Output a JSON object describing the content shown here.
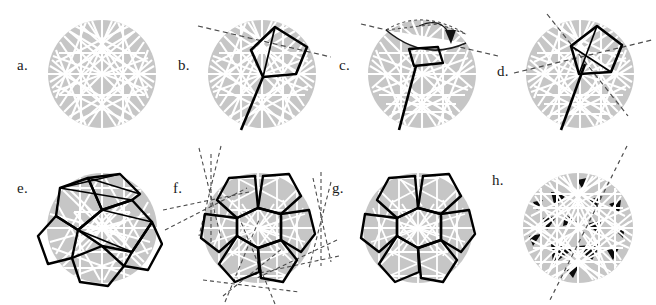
{
  "figure": {
    "type": "geometric-construction-sequence",
    "background_color": "#ffffff",
    "disk_fill_color": "#c6c6c6",
    "chord_color": "#ffffff",
    "heavy_line_color": "#000000",
    "dashed_line_color": "#4d4d4d",
    "dark_fill_color": "#0a0a0a",
    "panel_count": 8,
    "rows": 2,
    "columns": 4,
    "width": 651,
    "height": 305
  },
  "panels": [
    {
      "id": "a",
      "label": "a.",
      "label_x": 17,
      "label_y": 57,
      "cx": 102,
      "cy": 74,
      "r": 54,
      "description": "disk with full white chord arrangement",
      "has_disk": true,
      "has_chords": true,
      "chord_count": 34,
      "heavy_polygon": false,
      "dashed_lines": 0,
      "dark_triangles": 0,
      "arrow": false
    },
    {
      "id": "b",
      "label": "b.",
      "label_x": 178,
      "label_y": 57,
      "cx": 262,
      "cy": 74,
      "r": 54,
      "description": "pentagon outlined heavy with cut line and one dashed secant",
      "has_disk": true,
      "has_chords": true,
      "chord_count": 30,
      "heavy_polygon": true,
      "dashed_lines": 1,
      "dark_triangles": 0,
      "arrow": false
    },
    {
      "id": "c",
      "label": "c.",
      "label_x": 335,
      "label_y": 57,
      "cx": 422,
      "cy": 74,
      "r": 54,
      "description": "flap folded over with curved rotation arrow and dotted outline of pre-fold position",
      "has_disk": true,
      "has_chords": true,
      "chord_count": 26,
      "heavy_polygon": true,
      "dashed_lines": 2,
      "dark_triangles": 0,
      "arrow": true,
      "arrow_type": "curved-fold-arrow"
    },
    {
      "id": "d",
      "label": "d.",
      "label_x": 495,
      "label_y": 63,
      "cx": 580,
      "cy": 74,
      "r": 54,
      "description": "pentagon with two crossing dashed secant lines",
      "has_disk": true,
      "has_chords": true,
      "chord_count": 32,
      "heavy_polygon": true,
      "dashed_lines": 2,
      "dark_triangles": 0,
      "arrow": false
    },
    {
      "id": "e",
      "label": "e.",
      "label_x": 17,
      "label_y": 180,
      "cx": 102,
      "cy": 228,
      "r": 55,
      "description": "heavy polygonal net of six pentagons around centre star",
      "has_disk": true,
      "has_chords": true,
      "chord_count": 28,
      "heavy_polygon": true,
      "heavy_polygon_count": 7,
      "dashed_lines": 0,
      "dark_triangles": 0,
      "arrow": false
    },
    {
      "id": "f",
      "label": "f.",
      "label_x": 172,
      "label_y": 180,
      "cx": 258,
      "cy": 228,
      "r": 55,
      "description": "pentagon rosette with radiating dashed mirror lines beyond the disk",
      "has_disk": true,
      "has_chords": true,
      "chord_count": 30,
      "heavy_polygon": true,
      "heavy_polygon_count": 7,
      "dashed_lines": 12,
      "dark_triangles": 0,
      "arrow": false
    },
    {
      "id": "g",
      "label": "g.",
      "label_x": 332,
      "label_y": 180,
      "cx": 418,
      "cy": 228,
      "r": 55,
      "description": "clean pentagon rosette, white star chords inside each pentagon",
      "has_disk": true,
      "has_chords": true,
      "chord_count": 30,
      "heavy_polygon": true,
      "heavy_polygon_count": 7,
      "dashed_lines": 0,
      "dark_triangles": 0,
      "arrow": false
    },
    {
      "id": "h",
      "label": "h.",
      "label_x": 492,
      "label_y": 172,
      "cx": 578,
      "cy": 228,
      "r": 55,
      "description": "triangulated disk with black filled triangles and one dashed diameter",
      "has_disk": true,
      "has_chords": true,
      "chord_count": 40,
      "heavy_polygon": false,
      "dashed_lines": 1,
      "dark_triangles": 14,
      "arrow": false
    }
  ]
}
